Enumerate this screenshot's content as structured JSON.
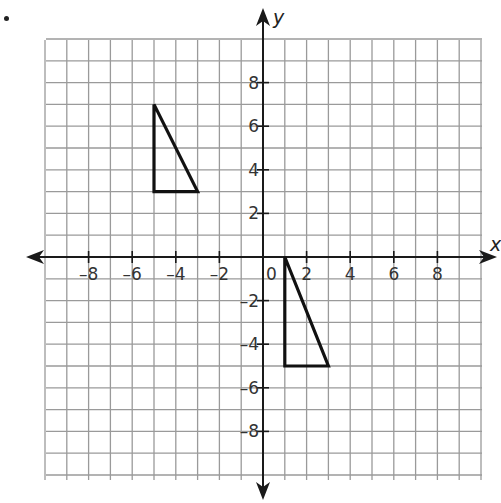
{
  "problem": {
    "bullet": "•"
  },
  "chart_data": {
    "type": "scatter",
    "title": "",
    "xlabel": "x",
    "ylabel": "y",
    "xlim": [
      -10,
      10
    ],
    "ylim": [
      -10,
      10
    ],
    "grid": true,
    "x_tick_labels": [
      "-8",
      "-6",
      "-4",
      "-2",
      "0",
      "2",
      "4",
      "6",
      "8"
    ],
    "y_tick_labels": [
      "8",
      "6",
      "4",
      "2",
      "-2",
      "-4",
      "-6",
      "-8"
    ],
    "origin_label": "0",
    "shapes": [
      {
        "name": "triangle-1",
        "type": "polygon",
        "vertices": [
          [
            -5,
            7
          ],
          [
            -5,
            3
          ],
          [
            -3,
            3
          ]
        ]
      },
      {
        "name": "triangle-2",
        "type": "polygon",
        "vertices": [
          [
            1,
            0
          ],
          [
            1,
            -5
          ],
          [
            3,
            -5
          ]
        ]
      }
    ]
  },
  "style": {
    "grid_color": "#9a9a9a",
    "axis_color": "#1a1a1a",
    "shape_color": "#111111"
  }
}
